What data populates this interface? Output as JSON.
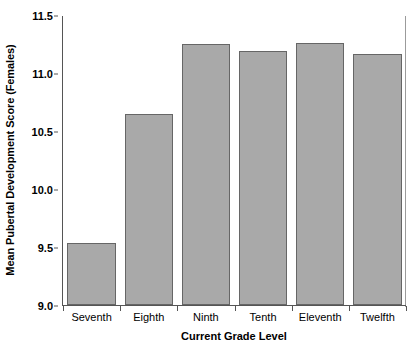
{
  "chart_data": {
    "type": "bar",
    "title": "",
    "subtitle": "",
    "xlabel": "Current Grade Level",
    "ylabel": "Mean Pubertal Development Score (Females)",
    "categories": [
      "Seventh",
      "Eighth",
      "Ninth",
      "Tenth",
      "Eleventh",
      "Twelfth"
    ],
    "values": [
      9.54,
      10.65,
      11.26,
      11.2,
      11.27,
      11.17
    ],
    "series": [
      {
        "name": "Mean Pubertal Development Score (Females)",
        "values": [
          9.54,
          10.65,
          11.26,
          11.2,
          11.27,
          11.17
        ]
      }
    ],
    "ylim": [
      9.0,
      11.5
    ],
    "yticks": [
      9.0,
      9.5,
      10.0,
      10.5,
      11.0,
      11.5
    ],
    "ytick_labels": [
      "9.0",
      "9.5",
      "10.0",
      "10.5",
      "11.0",
      "11.5"
    ],
    "grid": false,
    "legend": null,
    "legend_position": "none",
    "bar_color": "#a9a9a9",
    "bar_edge_color": "#666666",
    "axis_color": "#555555",
    "background_color": "#ffffff",
    "annotations": []
  }
}
